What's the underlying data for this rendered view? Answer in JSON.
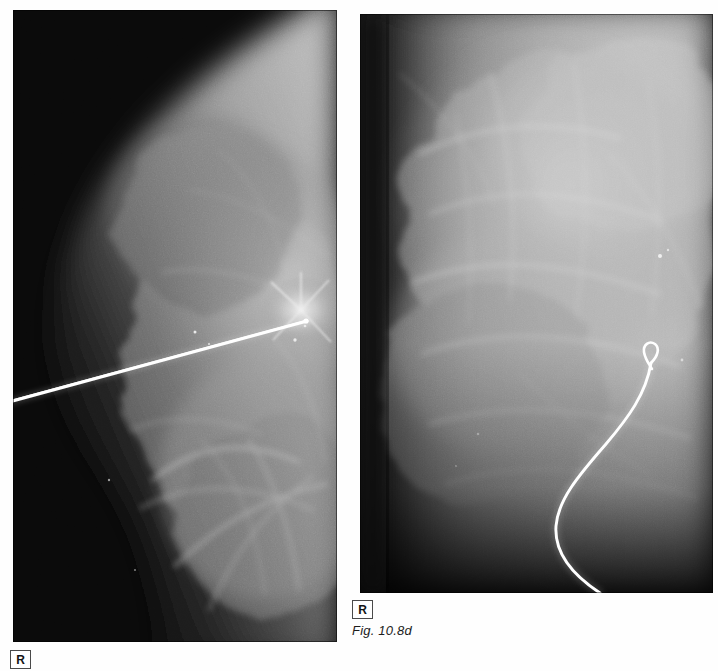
{
  "figure": {
    "caption": "Fig. 10.8d",
    "modality": "mammogram",
    "panel_count": 2
  },
  "panels": [
    {
      "id": "left",
      "data_name": "mammogram-left",
      "view_label": "R",
      "laterality_marker": "R",
      "description": "Mediolateral mammogram of the right breast with a straight hookwire localization needle directed toward a dense spiculated lesion in the upper breast.",
      "background_color": "#080808",
      "tissue_color": "#b9b9b9",
      "device": {
        "name": "localization-needle",
        "shape": "straight",
        "color": "#ffffff",
        "entry_point": [
          0,
          388
        ],
        "tip_point": [
          292,
          312
        ]
      },
      "x": 13,
      "y": 10,
      "width": 324,
      "height": 632
    },
    {
      "id": "right",
      "data_name": "mammogram-right",
      "view_label": "R",
      "laterality_marker": "R",
      "description": "Craniocaudal mammogram of the right breast showing the curved hookwire in place within dense fibroglandular tissue.",
      "background_color": "#0a0a0a",
      "tissue_color": "#c3c3c3",
      "device": {
        "name": "localization-hookwire",
        "shape": "curved-with-hook",
        "color": "#ffffff",
        "hook_point": [
          290,
          348
        ],
        "exit_point": [
          240,
          579
        ]
      },
      "x": 360,
      "y": 14,
      "width": 353,
      "height": 579
    }
  ],
  "markers": {
    "laterality_right": "R"
  },
  "colors": {
    "page_background": "#ffffff",
    "marker_border": "#4a4a4a",
    "marker_text": "#141414",
    "caption_text": "#1c1c1c",
    "wire": "#ffffff"
  }
}
